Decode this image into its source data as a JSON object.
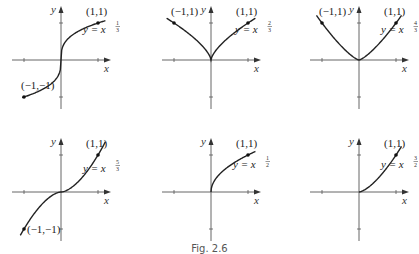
{
  "figure": {
    "caption": "Fig. 2.6",
    "axis_labels": {
      "x": "x",
      "y": "y"
    }
  },
  "chart_data": [
    {
      "type": "line",
      "title": "y = x^(1/3)",
      "equation_base": "y = x",
      "exp_num": "1",
      "exp_den": "3",
      "xlim": [
        -1,
        1
      ],
      "ylim": [
        -1,
        1
      ],
      "points_labeled": [
        {
          "label": "(1,1)",
          "x": 1,
          "y": 1
        },
        {
          "label": "(−1,−1)",
          "x": -1,
          "y": -1
        }
      ]
    },
    {
      "type": "line",
      "title": "y = x^(2/3)",
      "equation_base": "y = x",
      "exp_num": "2",
      "exp_den": "3",
      "xlim": [
        -1,
        1
      ],
      "ylim": [
        -1,
        1
      ],
      "points_labeled": [
        {
          "label": "(1,1)",
          "x": 1,
          "y": 1
        },
        {
          "label": "(−1,1)",
          "x": -1,
          "y": 1
        }
      ]
    },
    {
      "type": "line",
      "title": "y = x^(4/3)",
      "equation_base": "y = x",
      "exp_num": "4",
      "exp_den": "3",
      "xlim": [
        -1,
        1
      ],
      "ylim": [
        -1,
        1
      ],
      "points_labeled": [
        {
          "label": "(1,1)",
          "x": 1,
          "y": 1
        },
        {
          "label": "(−1,1)",
          "x": -1,
          "y": 1
        }
      ]
    },
    {
      "type": "line",
      "title": "y = x^(5/3)",
      "equation_base": "y = x",
      "exp_num": "5",
      "exp_den": "3",
      "xlim": [
        -1,
        1
      ],
      "ylim": [
        -1,
        1
      ],
      "points_labeled": [
        {
          "label": "(1,1)",
          "x": 1,
          "y": 1
        },
        {
          "label": "(−1,−1)",
          "x": -1,
          "y": -1
        }
      ]
    },
    {
      "type": "line",
      "title": "y = x^(1/2)",
      "equation_base": "y = x",
      "exp_num": "1",
      "exp_den": "2",
      "xlim": [
        -1,
        1
      ],
      "ylim": [
        -1,
        1
      ],
      "points_labeled": [
        {
          "label": "(1,1)",
          "x": 1,
          "y": 1
        }
      ]
    },
    {
      "type": "line",
      "title": "y = x^(3/2)",
      "equation_base": "y = x",
      "exp_num": "3",
      "exp_den": "2",
      "xlim": [
        -1,
        1
      ],
      "ylim": [
        -1,
        1
      ],
      "points_labeled": [
        {
          "label": "(1,1)",
          "x": 1,
          "y": 1
        }
      ]
    }
  ]
}
